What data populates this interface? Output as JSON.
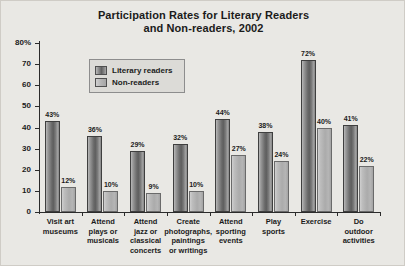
{
  "chart_data": {
    "type": "bar",
    "title": "Participation Rates for Literary Readers and Non-readers, 2002",
    "title_line1": "Participation Rates for Literary Readers",
    "title_line2": "and Non-readers, 2002",
    "xlabel": "",
    "ylabel": "",
    "ylim": [
      0,
      80
    ],
    "grid": false,
    "legend_position": "upper-left-inside",
    "ytick_labels": [
      "80%",
      "70",
      "60",
      "50",
      "40",
      "30",
      "20",
      "10",
      "0"
    ],
    "ytick_values": [
      80,
      70,
      60,
      50,
      40,
      30,
      20,
      10,
      0
    ],
    "categories": [
      "Visit art\nmuseums",
      "Attend\nplays or\nmusicals",
      "Attend\njazz or\nclassical\nconcerts",
      "Create\nphotographs,\npaintings\nor writings",
      "Attend\nsporting\nevents",
      "Play\nsports",
      "Exercise",
      "Do\noutdoor\nactivities"
    ],
    "series": [
      {
        "name": "Literary readers",
        "color": "#6d6d6d",
        "values": [
          43,
          36,
          29,
          32,
          44,
          38,
          72,
          41
        ],
        "data_labels": [
          "43%",
          "36%",
          "29%",
          "32%",
          "44%",
          "38%",
          "72%",
          "41%"
        ]
      },
      {
        "name": "Non-readers",
        "color": "#ababab",
        "values": [
          12,
          10,
          9,
          10,
          27,
          24,
          40,
          22
        ],
        "data_labels": [
          "12%",
          "10%",
          "9%",
          "10%",
          "27%",
          "24%",
          "40%",
          "22%"
        ]
      }
    ]
  },
  "legend": {
    "items": [
      {
        "label": "Literary readers",
        "swatch": "dark"
      },
      {
        "label": "Non-readers",
        "swatch": "light"
      }
    ]
  },
  "colors": {
    "background": "#e9e8e4",
    "legend_background": "#dcdbd7",
    "axis": "#2b2b2b",
    "text": "#1b1b1b",
    "series_literary": "#6d6d6d",
    "series_nonreaders": "#ababab"
  }
}
